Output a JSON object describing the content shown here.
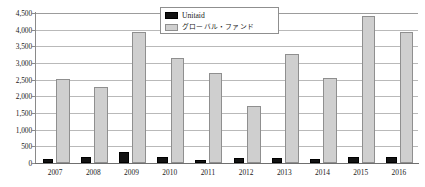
{
  "chart_data": {
    "type": "bar",
    "title": "",
    "subtitle": "",
    "xlabel": "",
    "ylabel": "",
    "categories": [
      "2007",
      "2008",
      "2009",
      "2010",
      "2011",
      "2012",
      "2013",
      "2014",
      "2015",
      "2016"
    ],
    "series": [
      {
        "name": "Unitaid",
        "color": "#121212",
        "values": [
          130,
          180,
          320,
          190,
          100,
          150,
          160,
          110,
          170,
          175
        ]
      },
      {
        "name": "グローバル・ファンド",
        "color": "#cfcfcf",
        "values": [
          2510,
          2280,
          3930,
          3150,
          2710,
          1720,
          3270,
          2550,
          4410,
          3940
        ]
      }
    ],
    "ylim": [
      0,
      4500
    ],
    "ytick_values": [
      0,
      500,
      1000,
      1500,
      2000,
      2500,
      3000,
      3500,
      4000,
      4500
    ],
    "ytick_labels": [
      "0",
      "500",
      "1,000",
      "1,500",
      "2,000",
      "2,500",
      "3,000",
      "3,500",
      "4,000",
      "4,500"
    ],
    "grid": true,
    "legend_position": "top-center",
    "legend_entries": [
      "Unitaid",
      "グローバル・ファンド"
    ]
  },
  "legend": {
    "unitaid_label": "Unitaid",
    "globalfund_label": "グローバル・ファンド"
  }
}
